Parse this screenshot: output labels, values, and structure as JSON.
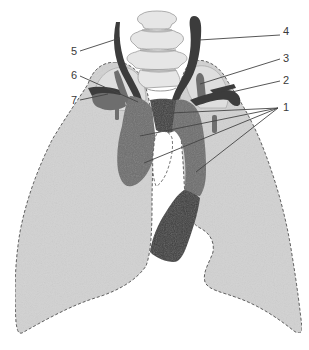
{
  "diagram": {
    "colors": {
      "background": "#ffffff",
      "lung_fill": "#d2d2d2",
      "lung_outline": "#555555",
      "apex_fill": "#e0e0e0",
      "vessel_mid": "#6e6e6e",
      "vessel_dark": "#3c3c3c",
      "vertebra_fill": "#e6e6e6",
      "vertebra_outline": "#9a9a9a",
      "leader_line": "#444444",
      "label_text": "#3a3a3a"
    },
    "labels": [
      {
        "id": "1",
        "text": "1",
        "x": 292,
        "y": 103
      },
      {
        "id": "2",
        "text": "2",
        "x": 283,
        "y": 76
      },
      {
        "id": "3",
        "text": "3",
        "x": 283,
        "y": 53
      },
      {
        "id": "4",
        "text": "4",
        "x": 283,
        "y": 31
      },
      {
        "id": "5",
        "text": "5",
        "x": 71,
        "y": 46
      },
      {
        "id": "6",
        "text": "6",
        "x": 71,
        "y": 71
      },
      {
        "id": "7",
        "text": "7",
        "x": 71,
        "y": 96
      }
    ]
  }
}
